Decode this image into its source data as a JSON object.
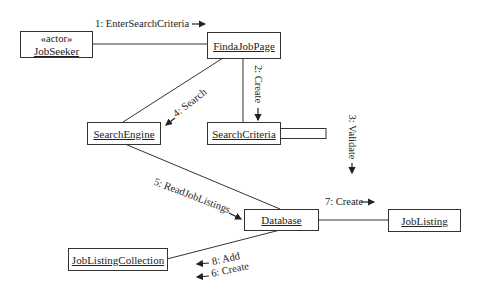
{
  "diagram": {
    "type": "uml-communication-diagram",
    "objects": {
      "job_seeker": {
        "stereotype": "«actor»",
        "name": "JobSeeker"
      },
      "find_a_job_page": {
        "name": "FindaJobPage"
      },
      "search_criteria": {
        "name": "SearchCriteria"
      },
      "search_engine": {
        "name": "SearchEngine"
      },
      "database": {
        "name": "Database"
      },
      "job_listing": {
        "name": "JobListing"
      },
      "job_listing_collection": {
        "name": "JobListingCollection"
      }
    },
    "messages": {
      "m1": {
        "text": "1: EnterSearchCriteria",
        "from": "JobSeeker",
        "to": "FindaJobPage",
        "arrow": "→"
      },
      "m2": {
        "text": "2: Create",
        "from": "FindaJobPage",
        "to": "SearchCriteria",
        "arrow": "↓"
      },
      "m3": {
        "text": "3: Validate",
        "from": "SearchCriteria",
        "to": "SearchCriteria",
        "arrow": "↓"
      },
      "m4": {
        "text": "4: Search",
        "from": "FindaJobPage",
        "to": "SearchEngine",
        "arrow": "↙"
      },
      "m5": {
        "text": "5: ReadJobListings",
        "from": "SearchEngine",
        "to": "Database",
        "arrow": "→"
      },
      "m6": {
        "text": "6: Create",
        "from": "Database",
        "to": "JobListingCollection",
        "arrow": "←"
      },
      "m7": {
        "text": "7: Create",
        "from": "Database",
        "to": "JobListing",
        "arrow": "→"
      },
      "m8": {
        "text": "8: Add",
        "from": "Database",
        "to": "JobListingCollection",
        "arrow": "←"
      }
    },
    "colors": {
      "line": "#333333",
      "background": "#ffffff",
      "text": "#222222"
    }
  }
}
